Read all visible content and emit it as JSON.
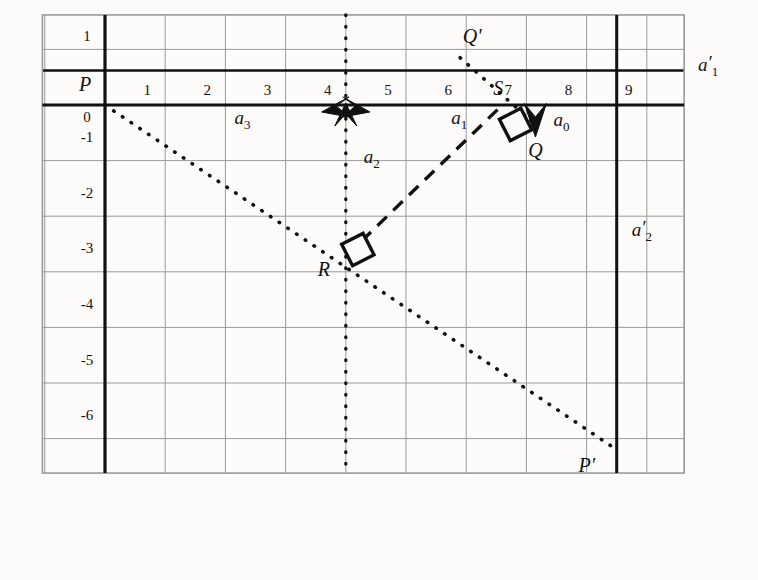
{
  "figure": {
    "kind": "geometry-diagram",
    "title_visible": false,
    "background_color": "#fdfcfa",
    "ink_color": "#111111",
    "grid_color": "#9a9a9a",
    "axis_color": "#111111"
  },
  "axes": {
    "x_tick_labels": [
      "1",
      "2",
      "3",
      "4",
      "5",
      "6",
      "7",
      "8",
      "9"
    ],
    "x_tick_values": [
      1,
      2,
      3,
      4,
      5,
      6,
      7,
      8,
      9
    ],
    "y_tick_labels": [
      "1",
      "0",
      "-1",
      "-2",
      "-3",
      "-4",
      "-5",
      "-6"
    ],
    "y_tick_values": [
      1,
      0,
      -1,
      -2,
      -3,
      -4,
      -5,
      -6
    ],
    "x_range": [
      -1,
      9.6
    ],
    "y_range": [
      -6.6,
      1.6
    ],
    "grid": true
  },
  "lines": [
    {
      "name": "a1-prime-horizontal-axis",
      "label": "a'₁",
      "style": "thick-solid",
      "orientation": "horizontal",
      "at": 0
    },
    {
      "name": "a2-prime-vertical-line",
      "label": "a'₂",
      "style": "thick-solid",
      "orientation": "vertical",
      "at": 8.5
    },
    {
      "name": "a2-vertical-dotted-line",
      "label": "a₂",
      "style": "dotted",
      "orientation": "vertical",
      "at": 4
    },
    {
      "name": "segment-a3",
      "label": "a₃",
      "style": "thick-solid",
      "from": [
        0,
        0
      ],
      "to": [
        4,
        0
      ]
    },
    {
      "name": "segment-a1",
      "label": "a₁",
      "style": "thick-solid",
      "from": [
        4,
        0
      ],
      "to": [
        6.6,
        0
      ]
    },
    {
      "name": "segment-a0",
      "label": "a₀",
      "style": "arrow-down",
      "from": [
        7.1,
        0
      ],
      "to": [
        7.1,
        -0.45
      ]
    },
    {
      "name": "dotted-ray-P-to-Pprime",
      "style": "dotted",
      "from": [
        0,
        0
      ],
      "to": [
        8.5,
        -6.2
      ]
    },
    {
      "name": "dotted-ray-Qprime-through-S",
      "style": "dotted",
      "from": [
        5.9,
        0.85
      ],
      "to": [
        7.15,
        -0.35
      ]
    },
    {
      "name": "dashed-segment-R-to-S",
      "style": "dashed",
      "from": [
        4,
        -2.72
      ],
      "to": [
        6.6,
        0
      ]
    }
  ],
  "points": [
    {
      "name": "point-P",
      "label": "P",
      "x": 0,
      "y": 0,
      "label_dx": -20,
      "label_dy": -14
    },
    {
      "name": "point-S",
      "label": "S",
      "x": 6.6,
      "y": 0,
      "label_dx": -4,
      "label_dy": -10
    },
    {
      "name": "point-Q",
      "label": "Q",
      "x": 7.15,
      "y": -0.62,
      "label_dx": 0,
      "label_dy": 18
    },
    {
      "name": "point-Qprime",
      "label": "Q'",
      "x": 6.2,
      "y": 1.0,
      "label_dx": -6,
      "label_dy": -6
    },
    {
      "name": "point-R",
      "label": "R",
      "x": 4,
      "y": -2.72,
      "label_dx": -22,
      "label_dy": 20
    },
    {
      "name": "point-Pprime",
      "label": "P'",
      "x": 8.5,
      "y": -6.2,
      "label_dx": -30,
      "label_dy": 22
    }
  ],
  "markers": [
    {
      "name": "right-angle-marker-at-S",
      "kind": "diamond",
      "x": 6.82,
      "y": -0.35
    },
    {
      "name": "right-angle-marker-at-R",
      "kind": "diamond",
      "x": 4.2,
      "y": -2.6
    },
    {
      "name": "arrowhead-up-at-x4",
      "kind": "arrow-up",
      "x": 4,
      "y": 0
    },
    {
      "name": "arrowhead-left-at-x4",
      "kind": "arrow-left",
      "x": 4,
      "y": 0
    },
    {
      "name": "arrowhead-right-at-x4",
      "kind": "arrow-right",
      "x": 4,
      "y": 0
    },
    {
      "name": "arrowhead-down-at-Q",
      "kind": "arrow-down",
      "x": 7.15,
      "y": -0.18
    }
  ],
  "segment_labels": [
    {
      "name": "label-a3",
      "base": "a",
      "sub": "3",
      "x": 2.15,
      "y": -0.35
    },
    {
      "name": "label-a1",
      "base": "a",
      "sub": "1",
      "x": 5.75,
      "y": -0.35
    },
    {
      "name": "label-a0",
      "base": "a",
      "sub": "0",
      "x": 7.45,
      "y": -0.38
    },
    {
      "name": "label-a2",
      "base": "a",
      "sub": "2",
      "x": 4.3,
      "y": -1.05
    },
    {
      "name": "label-a1-prime",
      "base": "a",
      "sub": "1",
      "prime": true,
      "x": 9.85,
      "y": 0.62
    },
    {
      "name": "label-a2-prime",
      "base": "a",
      "sub": "2",
      "prime": true,
      "x": 8.75,
      "y": -2.35
    }
  ]
}
